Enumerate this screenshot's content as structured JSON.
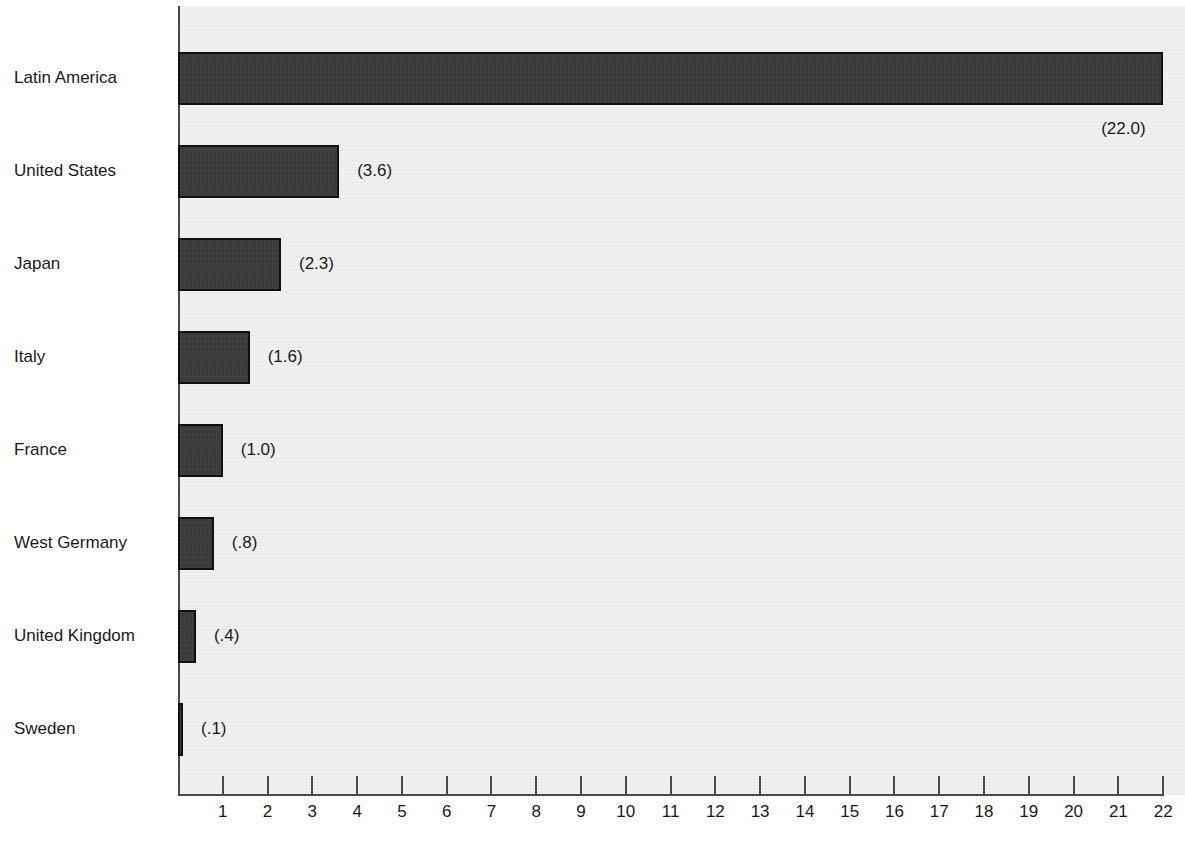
{
  "chart_data": {
    "type": "bar",
    "orientation": "horizontal",
    "title": "",
    "xlabel": "",
    "ylabel": "",
    "categories": [
      "Latin America",
      "United States",
      "Japan",
      "Italy",
      "France",
      "West Germany",
      "United Kingdom",
      "Sweden"
    ],
    "values": [
      22.0,
      3.6,
      2.3,
      1.6,
      1.0,
      0.8,
      0.4,
      0.1
    ],
    "value_labels": [
      "(22.0)",
      "(3.6)",
      "(2.3)",
      "(1.6)",
      "(1.0)",
      "(.8)",
      "(.4)",
      "(.1)"
    ],
    "xlim": [
      0,
      22
    ],
    "xticks": [
      1,
      2,
      3,
      4,
      5,
      6,
      7,
      8,
      9,
      10,
      11,
      12,
      13,
      14,
      15,
      16,
      17,
      18,
      19,
      20,
      21,
      22
    ],
    "xtick_labels": [
      "1",
      "2",
      "3",
      "4",
      "5",
      "6",
      "7",
      "8",
      "9",
      "10",
      "11",
      "12",
      "13",
      "14",
      "15",
      "16",
      "17",
      "18",
      "19",
      "20",
      "21",
      "22"
    ],
    "grid": false,
    "legend": null,
    "colors": {
      "bar_fill": "#3a3a3a",
      "bar_edge": "#101010",
      "plot_background": "#f0f0f0",
      "page_background": "#ffffff",
      "axis": "#4a4a4a",
      "text": "#1a1a1a"
    }
  }
}
